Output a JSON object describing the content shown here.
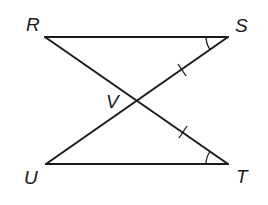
{
  "diagram": {
    "type": "geometry-figure",
    "stroke_color": "#1a1a1a",
    "points": {
      "R": {
        "label": "R",
        "x": 45,
        "y": 37
      },
      "S": {
        "label": "S",
        "x": 228,
        "y": 37
      },
      "U": {
        "label": "U",
        "x": 46,
        "y": 164
      },
      "T": {
        "label": "T",
        "x": 228,
        "y": 164
      },
      "V": {
        "label": "V",
        "x": 138,
        "y": 101
      }
    },
    "segments": [
      "RS",
      "UT",
      "RT",
      "US"
    ],
    "congruence_marks": {
      "tick_marks": [
        "VS",
        "VT"
      ],
      "angle_arcs": [
        "S",
        "T"
      ]
    }
  }
}
